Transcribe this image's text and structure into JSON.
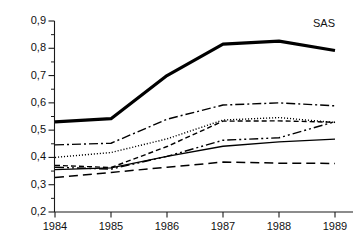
{
  "chart_data": {
    "type": "line",
    "title": "",
    "subtitle": "",
    "xlabel": "",
    "ylabel": "",
    "categories": [
      "1984",
      "1985",
      "1986",
      "1987",
      "1988",
      "1989"
    ],
    "x": [
      1984,
      1985,
      1986,
      1987,
      1988,
      1989
    ],
    "xlim": [
      1984,
      1989
    ],
    "ylim": [
      0.2,
      0.9
    ],
    "ytick_labels": [
      "0,9",
      "0,8",
      "0,7",
      "0,6",
      "0,5",
      "0,4",
      "0,3",
      "0,2"
    ],
    "ytick_values": [
      0.9,
      0.8,
      0.7,
      0.6,
      0.5,
      0.4,
      0.3,
      0.2
    ],
    "ytick_minor_values": [
      0.85,
      0.75,
      0.65,
      0.55,
      0.45,
      0.35,
      0.25
    ],
    "xtick_labels": [
      "1984",
      "1985",
      "1986",
      "1987",
      "1988",
      "1989"
    ],
    "grid": false,
    "legend_position": "inline-right",
    "decimal_separator": ",",
    "axis_color": "#1a1a1a",
    "series": [
      {
        "name": "SAS",
        "label": "SAS",
        "style": "solid",
        "width": 3.2,
        "color": "#000000",
        "values": [
          0.53,
          0.542,
          0.7,
          0.815,
          0.826,
          0.792
        ]
      },
      {
        "name": "series-2",
        "label": "",
        "style": "dash-dot",
        "width": 1.4,
        "color": "#000000",
        "values": [
          0.446,
          0.452,
          0.54,
          0.592,
          0.6,
          0.589
        ]
      },
      {
        "name": "series-3",
        "label": "",
        "style": "dotted",
        "width": 1.4,
        "color": "#000000",
        "values": [
          0.4,
          0.418,
          0.468,
          0.537,
          0.546,
          0.528
        ]
      },
      {
        "name": "series-4",
        "label": "",
        "style": "dashed",
        "width": 1.4,
        "color": "#000000",
        "values": [
          0.371,
          0.363,
          0.44,
          0.533,
          0.534,
          0.529
        ]
      },
      {
        "name": "series-5",
        "label": "",
        "style": "dash-dot-dot",
        "width": 1.4,
        "color": "#000000",
        "values": [
          0.364,
          0.357,
          0.404,
          0.463,
          0.472,
          0.531
        ]
      },
      {
        "name": "series-6",
        "label": "",
        "style": "thin-solid",
        "width": 1.3,
        "color": "#000000",
        "values": [
          0.355,
          0.362,
          0.404,
          0.441,
          0.457,
          0.467
        ]
      },
      {
        "name": "series-7",
        "label": "",
        "style": "long-dash",
        "width": 1.5,
        "color": "#000000",
        "values": [
          0.326,
          0.345,
          0.364,
          0.383,
          0.379,
          0.378
        ]
      }
    ]
  },
  "chart": {
    "series_label_sas": "SAS"
  }
}
